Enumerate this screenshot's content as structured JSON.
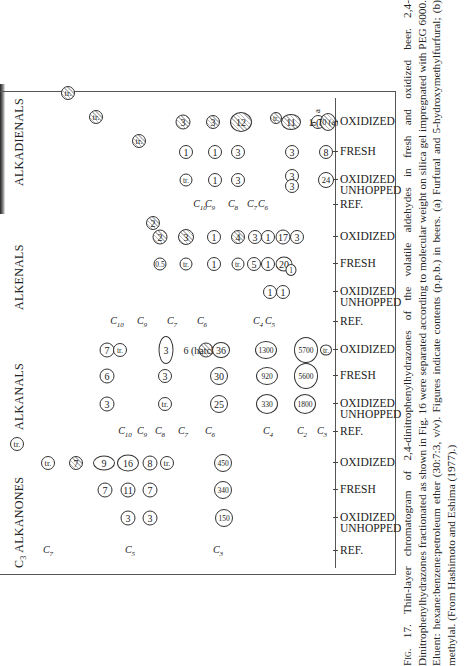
{
  "figure": {
    "groups": [
      {
        "id": "alkadienals",
        "title": "ALKADIENALS"
      },
      {
        "id": "alkenals",
        "title": "ALKENALS"
      },
      {
        "id": "alkanals",
        "title": "ALKANALS"
      },
      {
        "id": "alkanones",
        "title": "ALKANONES",
        "prefix": "C3"
      }
    ],
    "lanes": [
      {
        "group": "alkanones",
        "label": "REF."
      },
      {
        "group": "alkanones",
        "label": "OXIDIZED UNHOPPED"
      },
      {
        "group": "alkanones",
        "label": "FRESH"
      },
      {
        "group": "alkanones",
        "label": "OXIDIZED"
      },
      {
        "group": "alkanals",
        "label": "REF."
      },
      {
        "group": "alkanals",
        "label": "OXIDIZED UNHOPPED"
      },
      {
        "group": "alkanals",
        "label": "FRESH"
      },
      {
        "group": "alkanals",
        "label": "OXIDIZED"
      },
      {
        "group": "alkenals",
        "label": "REF."
      },
      {
        "group": "alkenals",
        "label": "OXIDIZED UNHOPPED"
      },
      {
        "group": "alkenals",
        "label": "FRESH"
      },
      {
        "group": "alkenals",
        "label": "OXIDIZED"
      },
      {
        "group": "alkadienals",
        "label": "REF."
      },
      {
        "group": "alkadienals",
        "label": "OXIDIZED UNHOPPED"
      },
      {
        "group": "alkadienals",
        "label": "FRESH"
      },
      {
        "group": "alkadienals",
        "label": "OXIDIZED"
      }
    ],
    "annotations": {
      "a": "a",
      "b": "b"
    },
    "caption": {
      "fig_label": "Fig. 17.",
      "text": "Thin-layer chromatogram of 2,4-dinitrophenylhydrazones of the volatile aldehydes in fresh and oxidized beer. 2,4-Dinitrophenylhydrazones fractionated as shown in Fig. 16 were separated according to molecular weight on silica gel impregnated with PEG 6000. Eluent: hexane:benzene:petroleum ether (30:7:3, v/v). Figures indicate contents (p.p.b.) in beers. (a) Furfural and 5-hydroxymethylfurfural; (b) methylal. (From Hashimoto and Eshima (1977).)"
    }
  },
  "chart_data": {
    "type": "table",
    "units": "p.p.b.",
    "groups": {
      "alkanones": {
        "reference_carbons": [
          "C3",
          "C4",
          "C5"
        ],
        "OXIDIZED": {
          "C3": "tr.",
          "C4": "tr.",
          "C5": "7 / 9",
          "C6": "16",
          "C7": "8",
          "C8": "tr.",
          "C5_main": "450"
        },
        "FRESH": [
          "7",
          "11",
          "7",
          "340"
        ],
        "OXIDIZED UNHOPPED": [
          "3",
          "3",
          "150"
        ]
      },
      "alkanals": {
        "reference_carbons": [
          "C10",
          "C9",
          "C8",
          "C7",
          "C6",
          "C4",
          "C2",
          "C3"
        ],
        "OXIDIZED": [
          "7",
          "tr.",
          "3",
          "6 (hatched)",
          "36",
          "1300",
          "5700",
          "tr."
        ],
        "FRESH": [
          "6",
          "3",
          "30",
          "920",
          "5600"
        ],
        "OXIDIZED UNHOPPED": [
          "3",
          "tr.",
          "25",
          "330",
          "1800"
        ]
      },
      "alkenals": {
        "reference_carbons": [
          "C10",
          "C9",
          "C7",
          "C6",
          "C4",
          "C5"
        ],
        "OXIDIZED": [
          "2",
          "2",
          "3",
          "1",
          "4",
          "3",
          "1",
          "17",
          "3"
        ],
        "FRESH": [
          "0.5",
          "tr.",
          "1",
          "tr.",
          "5",
          "1",
          "20",
          "1"
        ],
        "OXIDIZED UNHOPPED": [
          "1",
          "1"
        ]
      },
      "alkadienals": {
        "reference_carbons": [
          "C10",
          "C9",
          "C8",
          "C7",
          "C6"
        ],
        "OXIDIZED": [
          "tr.",
          "tr.",
          "tr.",
          "3",
          "3",
          "12",
          "tr.",
          "11",
          "1 (b)",
          "70 (a)"
        ],
        "FRESH": [
          "1",
          "1",
          "3",
          "3",
          "8"
        ],
        "OXIDIZED UNHOPPED": [
          "tr.",
          "1",
          "3",
          "3",
          "3",
          "24"
        ]
      }
    }
  }
}
